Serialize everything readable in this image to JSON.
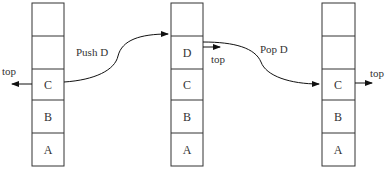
{
  "diagram": {
    "type": "stack-push-pop",
    "stacks": [
      {
        "id": "before",
        "cells_top_to_bottom": [
          "",
          "",
          "C",
          "B",
          "A"
        ],
        "top_label": "top",
        "top_pointer_side": "left",
        "top_pointer_cell_index": 2
      },
      {
        "id": "after-push",
        "cells_top_to_bottom": [
          "",
          "D",
          "C",
          "B",
          "A"
        ],
        "top_label": "top",
        "top_pointer_side": "right",
        "top_pointer_cell_index": 1
      },
      {
        "id": "after-pop",
        "cells_top_to_bottom": [
          "",
          "",
          "C",
          "B",
          "A"
        ],
        "top_label": "top",
        "top_pointer_side": "right",
        "top_pointer_cell_index": 2
      }
    ],
    "operations": [
      {
        "label": "Push D",
        "from": "before",
        "to": "after-push"
      },
      {
        "label": "Pop D",
        "from": "after-push",
        "to": "after-pop"
      }
    ]
  }
}
